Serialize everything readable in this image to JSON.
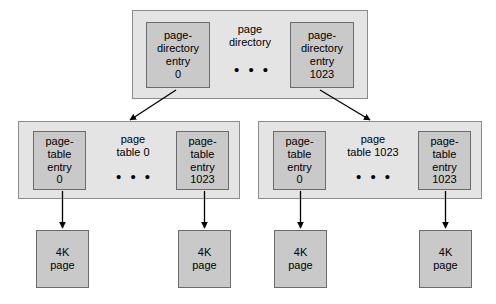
{
  "diagram": {
    "colors": {
      "container_fill": "#e4e4e4",
      "container_stroke": "#8c8c8c",
      "entry_fill": "#c9c9c9",
      "entry_stroke": "#6b6b6b",
      "arrow": "#000000",
      "page_background": "#ffffff"
    },
    "ellipsis": "• • •",
    "page_directory": {
      "label_lines": [
        "page",
        "directory"
      ],
      "entries": [
        {
          "lines": [
            "page-",
            "directory",
            "entry",
            "0"
          ]
        },
        {
          "lines": [
            "page-",
            "directory",
            "entry",
            "1023"
          ]
        }
      ]
    },
    "page_tables": [
      {
        "label_lines": [
          "page",
          "table 0"
        ],
        "entries": [
          {
            "lines": [
              "page-",
              "table",
              "entry",
              "0"
            ]
          },
          {
            "lines": [
              "page-",
              "table",
              "entry",
              "1023"
            ]
          }
        ]
      },
      {
        "label_lines": [
          "page",
          "table 1023"
        ],
        "entries": [
          {
            "lines": [
              "page-",
              "table",
              "entry",
              "0"
            ]
          },
          {
            "lines": [
              "page-",
              "table",
              "entry",
              "1023"
            ]
          }
        ]
      }
    ],
    "pages": [
      {
        "lines": [
          "4K",
          "page"
        ]
      },
      {
        "lines": [
          "4K",
          "page"
        ]
      },
      {
        "lines": [
          "4K",
          "page"
        ]
      },
      {
        "lines": [
          "4K",
          "page"
        ]
      }
    ]
  }
}
